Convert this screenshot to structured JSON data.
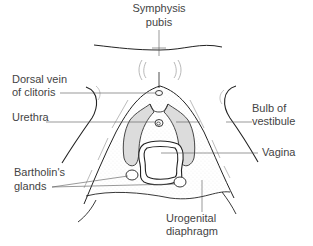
{
  "diagram": {
    "labels": {
      "symphysis_line1": "Symphysis",
      "symphysis_line2": "pubis",
      "dorsal_line1": "Dorsal vein",
      "dorsal_line2": "of clitoris",
      "urethra": "Urethra",
      "bulb_line1": "Bulb of",
      "bulb_line2": "vestibule",
      "vagina": "Vagina",
      "bartholin_line1": "Bartholin's",
      "bartholin_line2": "glands",
      "urogenital_line1": "Urogenital",
      "urogenital_line2": "diaphragm"
    },
    "colors": {
      "stroke": "#222222",
      "leader": "#555555",
      "bulb_fill": "#d9d9d9",
      "stipple": "#bbbbbb",
      "background": "#ffffff"
    }
  }
}
